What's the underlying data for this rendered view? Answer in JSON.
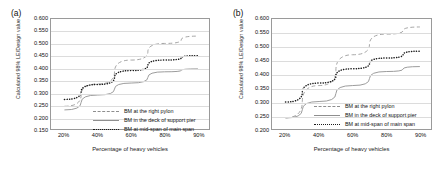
{
  "figure": {
    "panels": [
      {
        "label": "(a)",
        "xlabel": "Percentage of heavy vehicles",
        "ylabel": "Calculated 98% LE/Design value",
        "yticks": [
          "0.600",
          "0.550",
          "0.500",
          "0.450",
          "0.400",
          "0.350",
          "0.300",
          "0.250",
          "0.200",
          "0.150"
        ],
        "xticks": [
          "20%",
          "40%",
          "60%",
          "80%",
          "90%"
        ],
        "legend": [
          {
            "label": "BM at the right pylon",
            "style": "dashed"
          },
          {
            "label": "BM in the deck of support pier",
            "style": "solid"
          },
          {
            "label": "BM at mid-span of main span",
            "style": "dotted"
          }
        ]
      },
      {
        "label": "(b)",
        "xlabel": "Percentage of heavy vehicles",
        "ylabel": "Calculated 98% LE/Design value",
        "yticks": [
          "0.600",
          "0.550",
          "0.500",
          "0.450",
          "0.400",
          "0.350",
          "0.300",
          "0.250",
          "0.200"
        ],
        "xticks": [
          "20%",
          "40%",
          "60%",
          "80%",
          "90%"
        ],
        "legend": [
          {
            "label": "BM at the right pylon",
            "style": "dashed"
          },
          {
            "label": "BM in the deck of support pier",
            "style": "solid"
          },
          {
            "label": "BM at mid-span of main span",
            "style": "dotted"
          }
        ]
      }
    ]
  },
  "chart_data": [
    {
      "type": "line",
      "title": "(a)",
      "xlabel": "Percentage of heavy vehicles",
      "ylabel": "Calculated 98% LE/Design value",
      "x": [
        20,
        40,
        60,
        80,
        90
      ],
      "xtick_labels": [
        "20%",
        "40%",
        "60%",
        "80%",
        "90%"
      ],
      "ylim": [
        0.15,
        0.6
      ],
      "ytick_step": 0.05,
      "grid": true,
      "legend_position": "inside-bottom-right",
      "series": [
        {
          "name": "BM at the right pylon",
          "style": "dashed",
          "color": "#9a9a9a",
          "values": [
            0.243,
            0.334,
            0.432,
            0.5,
            0.53
          ]
        },
        {
          "name": "BM in the deck of support pier",
          "style": "solid",
          "color": "#9a9a9a",
          "values": [
            0.228,
            0.289,
            0.338,
            0.384,
            0.396
          ]
        },
        {
          "name": "BM at mid-span of main span",
          "style": "dotted",
          "color": "#1c1c1c",
          "values": [
            0.271,
            0.332,
            0.389,
            0.432,
            0.45
          ]
        }
      ]
    },
    {
      "type": "line",
      "title": "(b)",
      "xlabel": "Percentage of heavy vehicles",
      "ylabel": "Calculated 98% LE/Design value",
      "x": [
        20,
        40,
        60,
        80,
        90
      ],
      "xtick_labels": [
        "20%",
        "40%",
        "60%",
        "80%",
        "90%"
      ],
      "ylim": [
        0.2,
        0.6
      ],
      "ytick_step": 0.05,
      "grid": true,
      "legend_position": "inside-bottom-right",
      "series": [
        {
          "name": "BM at the right pylon",
          "style": "dashed",
          "color": "#9a9a9a",
          "values": [
            0.241,
            0.358,
            0.47,
            0.545,
            0.571
          ]
        },
        {
          "name": "BM in the deck of support pier",
          "style": "solid",
          "color": "#9a9a9a",
          "values": [
            0.24,
            0.3,
            0.358,
            0.409,
            0.427
          ]
        },
        {
          "name": "BM at mid-span of main span",
          "style": "dotted",
          "color": "#1c1c1c",
          "values": [
            0.298,
            0.367,
            0.419,
            0.458,
            0.483
          ]
        }
      ]
    }
  ]
}
